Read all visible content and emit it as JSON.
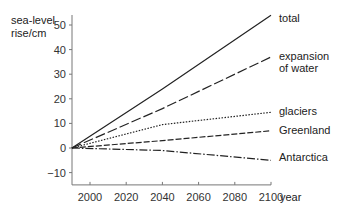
{
  "chart_data": {
    "type": "line",
    "title": "",
    "ylabel": [
      "sea-level",
      "rise/cm"
    ],
    "xlabel": "year",
    "x_ticks": [
      2000,
      2020,
      2040,
      2060,
      2080,
      2100
    ],
    "y_ticks": [
      -10,
      0,
      10,
      20,
      30,
      40,
      50
    ],
    "xlim": [
      1990,
      2100
    ],
    "ylim": [
      -15,
      55
    ],
    "grid": false,
    "legend_position": "inline-right",
    "x": [
      1990,
      2040,
      2100
    ],
    "series": [
      {
        "name": "total",
        "label_lines": [
          "total"
        ],
        "style": "solid",
        "values": [
          0,
          24,
          54
        ]
      },
      {
        "name": "expansion of water",
        "label_lines": [
          "expansion",
          "of water"
        ],
        "style": "long-dash",
        "values": [
          0,
          16,
          37
        ]
      },
      {
        "name": "glaciers",
        "label_lines": [
          "glaciers"
        ],
        "style": "dotted",
        "values": [
          0,
          9.5,
          14.5
        ]
      },
      {
        "name": "Greenland",
        "label_lines": [
          "Greenland"
        ],
        "style": "dashed",
        "values": [
          0,
          3,
          7
        ]
      },
      {
        "name": "Antarctica",
        "label_lines": [
          "Antarctica"
        ],
        "style": "dash-dot",
        "values": [
          0,
          -1,
          -5
        ]
      }
    ]
  }
}
